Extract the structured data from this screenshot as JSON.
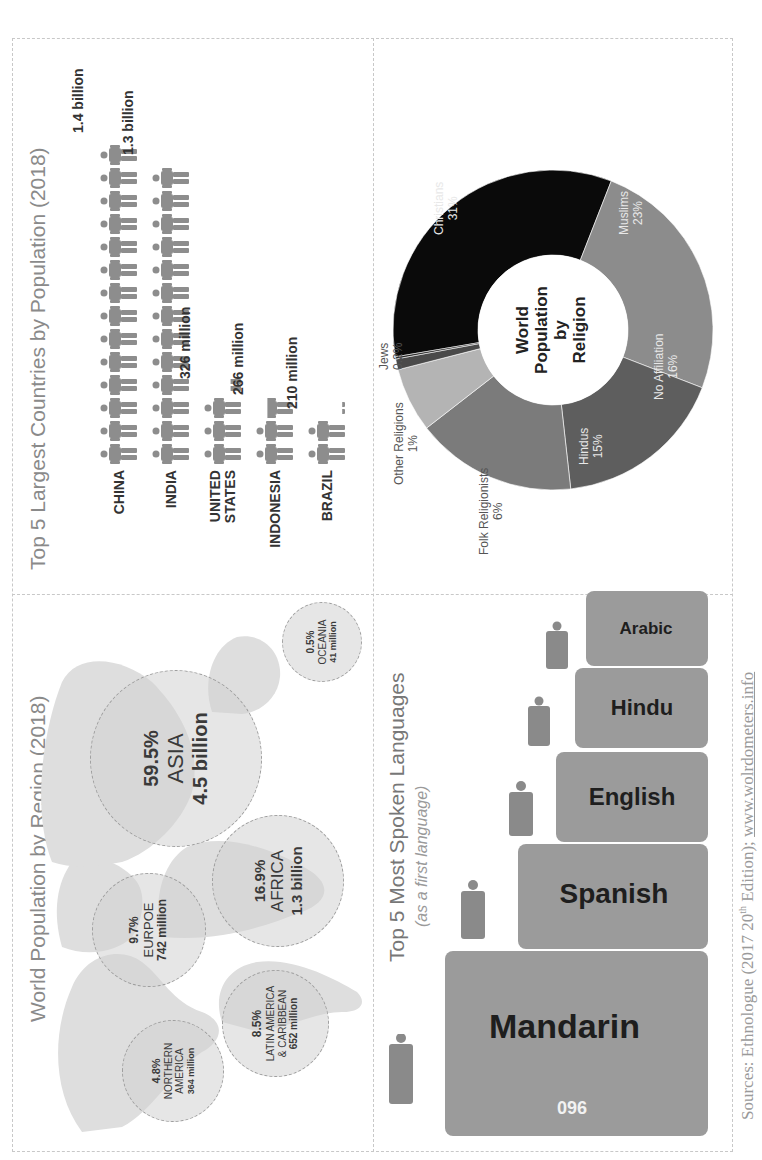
{
  "page": {
    "orientation": "rotated 90 degrees counter-clockwise",
    "source_prefix": "Sources: Ethnologue (2017 20",
    "source_sup": "th",
    "source_mid": " Edition); ",
    "source_link": "www.wolrdometers.info"
  },
  "region": {
    "title": "World Population by Region (2018)",
    "bubbles": [
      {
        "pct": "4.8%",
        "name": "NORTHERN AMERICA",
        "value": "364 million"
      },
      {
        "pct": "9.7%",
        "name": "EURPOE",
        "value": "742 million"
      },
      {
        "pct": "59.5%",
        "name": "ASIA",
        "value": "4.5 billion"
      },
      {
        "pct": "8.5%",
        "name": "LATIN AMERICA & CARIBBEAN",
        "value": "652 million"
      },
      {
        "pct": "16.9%",
        "name": "AFRICA",
        "value": "1.3 billion"
      },
      {
        "pct": "0.5%",
        "name": "OCEANIA",
        "value": "41 million"
      }
    ]
  },
  "countries": {
    "title": "Top 5 Largest Countries by Population (2018)",
    "rows": [
      {
        "name": "CHINA",
        "value": "1.4 billion",
        "icons": 14
      },
      {
        "name": "INDIA",
        "value": "1.3 billion",
        "icons": 13
      },
      {
        "name": "UNITED STATES",
        "value": "326 million",
        "icons": 3.3
      },
      {
        "name": "INDONESIA",
        "value": "266 million",
        "icons": 2.7
      },
      {
        "name": "BRAZIL",
        "value": "210 million",
        "icons": 2.1
      }
    ]
  },
  "languages": {
    "title": "Top 5 Most Spoken Languages",
    "subtitle": "(as a first language)",
    "items": [
      {
        "name": "Mandarin",
        "number": "960",
        "unit": "million"
      },
      {
        "name": "Spanish",
        "number": "570",
        "unit": "million"
      },
      {
        "name": "English",
        "number": "400",
        "unit": "million"
      },
      {
        "name": "Hindu",
        "number": "329",
        "unit": "million"
      },
      {
        "name": "Arabic",
        "number": "290",
        "unit": "million"
      }
    ]
  },
  "religion": {
    "center_line1": "World",
    "center_line2": "Population",
    "center_line3": "by",
    "center_line4": "Religion",
    "segments": [
      {
        "name": "Christians",
        "pct": "31%",
        "color": "#0a0a0a"
      },
      {
        "name": "Muslims",
        "pct": "23%",
        "color": "#8c8c8c"
      },
      {
        "name": "No Affiliation",
        "pct": "16%",
        "color": "#5e5e5e"
      },
      {
        "name": "Hindus",
        "pct": "15%",
        "color": "#7b7b7b"
      },
      {
        "name": "Folk Religionists",
        "pct": "6%",
        "color": "#b4b4b4"
      },
      {
        "name": "Other Religions",
        "pct": "1%",
        "color": "#4a4a4a"
      },
      {
        "name": "Jews",
        "pct": "0.2%",
        "color": "#222222"
      }
    ]
  },
  "chart_data": [
    {
      "type": "bubble",
      "title": "World Population by Region (2018)",
      "categories": [
        "Northern America",
        "Europe",
        "Asia",
        "Latin America & Caribbean",
        "Africa",
        "Oceania"
      ],
      "values_percent": [
        4.8,
        9.7,
        59.5,
        8.5,
        16.9,
        0.5
      ],
      "values_population": [
        "364 million",
        "742 million",
        "4.5 billion",
        "652 million",
        "1.3 billion",
        "41 million"
      ]
    },
    {
      "type": "bar",
      "title": "Top 5 Largest Countries by Population (2018)",
      "categories": [
        "China",
        "India",
        "United States",
        "Indonesia",
        "Brazil"
      ],
      "values": [
        1400,
        1300,
        326,
        266,
        210
      ],
      "unit": "million",
      "value_labels": [
        "1.4 billion",
        "1.3 billion",
        "326 million",
        "266 million",
        "210 million"
      ]
    },
    {
      "type": "bar",
      "title": "Top 5 Most Spoken Languages",
      "subtitle": "(as a first language)",
      "categories": [
        "Mandarin",
        "Spanish",
        "English",
        "Hindu",
        "Arabic"
      ],
      "values": [
        960,
        570,
        400,
        329,
        290
      ],
      "unit": "million"
    },
    {
      "type": "pie",
      "title": "World Population by Religion",
      "categories": [
        "Christians",
        "Muslims",
        "No Affiliation",
        "Hindus",
        "Folk Religionists",
        "Other Religions",
        "Jews"
      ],
      "values": [
        31,
        23,
        16,
        15,
        6,
        1,
        0.2
      ],
      "unit": "%"
    }
  ]
}
